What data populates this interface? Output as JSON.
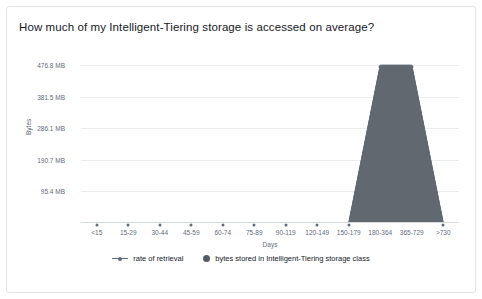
{
  "card": {
    "title": "How much of my Intelligent-Tiering storage is accessed on average?"
  },
  "chart_data": {
    "type": "area",
    "title": "How much of my Intelligent-Tiering storage is accessed on average?",
    "xlabel": "Days",
    "ylabel": "Bytes",
    "categories": [
      "<15",
      "15-29",
      "30-44",
      "45-59",
      "60-74",
      "75-89",
      "90-119",
      "120-149",
      "150-179",
      "180-364",
      "365-729",
      ">730"
    ],
    "ytick_labels": [
      "95.4 MB",
      "190.7 MB",
      "286.1 MB",
      "381.5 MB",
      "476.8 MB"
    ],
    "ytick_values": [
      95.4,
      190.7,
      286.1,
      381.5,
      476.8
    ],
    "ylim": [
      0,
      520
    ],
    "grid": true,
    "legend_position": "bottom",
    "series": [
      {
        "name": "rate of retrieval",
        "type": "line",
        "color": "#5f6b7a",
        "values": [
          0,
          0,
          0,
          0,
          0,
          0,
          0,
          0,
          0,
          476.8,
          476.8,
          0
        ]
      },
      {
        "name": "bytes stored in Intelligent-Tiering storage class",
        "type": "area",
        "color": "#545b64",
        "values": [
          0,
          0,
          0,
          0,
          0,
          0,
          0,
          0,
          0,
          476.8,
          476.8,
          0
        ]
      }
    ]
  },
  "legend": {
    "items": [
      {
        "label": "rate of retrieval",
        "marker": "line-with-dot",
        "color": "#5f6b7a"
      },
      {
        "label": "bytes stored in Intelligent-Tiering storage class",
        "marker": "filled-circle",
        "color": "#545b64"
      }
    ]
  }
}
